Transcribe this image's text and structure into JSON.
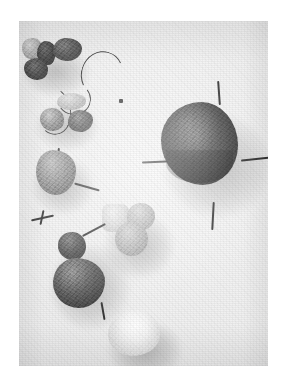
{
  "document": {
    "kind": "scanned-photograph-plate",
    "title": "Specimen photograph plate",
    "caption_line_1": "",
    "caption_line_2": ""
  },
  "colors": {
    "page_background": "#ffffff",
    "plate_background": "#efefef",
    "specimen_dark": "#4a4a4a",
    "specimen_mid": "#6e6e6e",
    "specimen_light": "#c9c9c9",
    "specimen_pale": "#e3e3e3",
    "pin_color": "#2f2f2f"
  },
  "plate": {
    "name": "photograph-plate",
    "x": 19,
    "y": 21,
    "width": 249,
    "height": 345
  },
  "specimens": [
    {
      "id": "s01",
      "name": "small-pale-nodule-upper-left",
      "tone": "light",
      "x": 22,
      "y": 38,
      "w": 20,
      "h": 21
    },
    {
      "id": "s02",
      "name": "dark-nodule-upper-left-a",
      "tone": "dark",
      "x": 37,
      "y": 41,
      "w": 19,
      "h": 24
    },
    {
      "id": "s03",
      "name": "dark-elongate-nodule-upper",
      "tone": "dark",
      "x": 53,
      "y": 38,
      "w": 29,
      "h": 23
    },
    {
      "id": "s04",
      "name": "dark-nodule-upper-left-b",
      "tone": "dark",
      "x": 24,
      "y": 58,
      "w": 24,
      "h": 22
    },
    {
      "id": "s05",
      "name": "pale-elongate-nodule-mid-upper",
      "tone": "pale",
      "x": 57,
      "y": 93,
      "w": 29,
      "h": 17
    },
    {
      "id": "s06",
      "name": "speckled-nodule-mid-left",
      "tone": "mid",
      "x": 40,
      "y": 108,
      "w": 24,
      "h": 23
    },
    {
      "id": "s07",
      "name": "dark-nodule-mid-center",
      "tone": "dark",
      "x": 68,
      "y": 110,
      "w": 25,
      "h": 22
    },
    {
      "id": "s08",
      "name": "large-rough-specimen-mid-left",
      "tone": "mid",
      "x": 36,
      "y": 150,
      "w": 40,
      "h": 45
    },
    {
      "id": "s09",
      "name": "pale-angular-fragment-lower-mid",
      "tone": "pale",
      "x": 102,
      "y": 204,
      "w": 27,
      "h": 28
    },
    {
      "id": "s10",
      "name": "pale-nodule-right-of-fragment",
      "tone": "pale",
      "x": 127,
      "y": 203,
      "w": 28,
      "h": 27
    },
    {
      "id": "s11",
      "name": "pale-nodule-lower-right-cluster",
      "tone": "pale",
      "x": 115,
      "y": 222,
      "w": 33,
      "h": 34
    },
    {
      "id": "s12",
      "name": "dark-nodule-lower-left",
      "tone": "dark",
      "x": 58,
      "y": 232,
      "w": 28,
      "h": 28
    },
    {
      "id": "s13",
      "name": "large-dark-specimen-lower-left",
      "tone": "dark",
      "x": 53,
      "y": 258,
      "w": 52,
      "h": 50
    },
    {
      "id": "s14",
      "name": "white-glossy-specimen-bottom",
      "tone": "white",
      "x": 108,
      "y": 309,
      "w": 52,
      "h": 47
    },
    {
      "id": "s15",
      "name": "large-dark-fruit-right",
      "tone": "dark",
      "x": 161,
      "y": 102,
      "w": 77,
      "h": 83
    }
  ],
  "markers": {
    "name": "pin-markers",
    "count": 4,
    "description_top": "pin-above-large-fruit",
    "description_left": "pin-left-of-large-fruit",
    "description_right": "pin-right-of-large-fruit",
    "description_bottom": "pin-below-large-fruit"
  }
}
